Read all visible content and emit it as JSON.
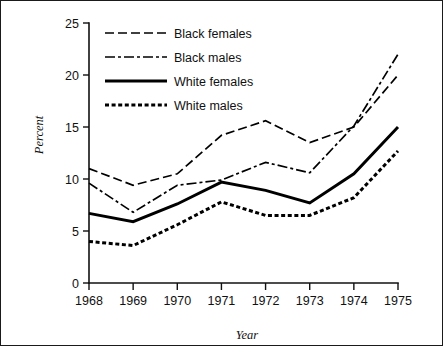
{
  "figure": {
    "border_color": "#1a1a1a",
    "background": "#ffffff"
  },
  "chart_data": {
    "type": "line",
    "title": "",
    "xlabel": "Year",
    "ylabel": "Percent",
    "categories": [
      "1968",
      "1969",
      "1970",
      "1971",
      "1972",
      "1973",
      "1974",
      "1975"
    ],
    "x": [
      1968,
      1969,
      1970,
      1971,
      1972,
      1973,
      1974,
      1975
    ],
    "xlim": [
      1968,
      1975
    ],
    "ylim": [
      0,
      25
    ],
    "yticks": [
      0,
      5,
      10,
      15,
      20,
      25
    ],
    "ytick_labels": [
      "0",
      "5",
      "10",
      "15",
      "20",
      "25"
    ],
    "grid": false,
    "legend_position": "top-left",
    "series": [
      {
        "name": "Black females",
        "style": "long-dash",
        "dasharray": "9,4",
        "width": 1.7,
        "color": "#000000",
        "values": [
          11.0,
          9.4,
          10.5,
          14.2,
          15.6,
          13.5,
          15.0,
          20.0
        ]
      },
      {
        "name": "Black males",
        "style": "dash-dot",
        "dasharray": "10,3,3,3",
        "width": 1.7,
        "color": "#000000",
        "values": [
          9.6,
          6.8,
          9.4,
          9.9,
          11.6,
          10.6,
          15.1,
          22.0
        ]
      },
      {
        "name": "White females",
        "style": "solid",
        "dasharray": "none",
        "width": 2.9,
        "color": "#000000",
        "values": [
          6.7,
          5.9,
          7.6,
          9.7,
          8.9,
          7.7,
          10.5,
          15.0
        ]
      },
      {
        "name": "White males",
        "style": "dotted",
        "dasharray": "4,2.6",
        "width": 3.0,
        "color": "#000000",
        "values": [
          4.0,
          3.6,
          5.6,
          7.8,
          6.5,
          6.5,
          8.2,
          12.7
        ]
      }
    ]
  },
  "legend": {
    "items": [
      {
        "label": "Black females"
      },
      {
        "label": "Black males"
      },
      {
        "label": "White females"
      },
      {
        "label": "White males"
      }
    ]
  }
}
